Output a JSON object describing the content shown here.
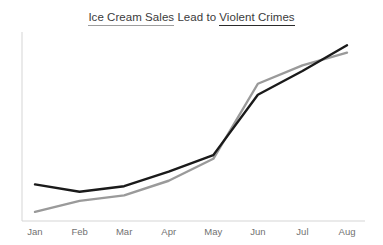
{
  "chart_data": {
    "type": "line",
    "title": "Ice Cream Sales Lead to Violent Crimes",
    "title_parts": [
      {
        "text": "Ice Cream Sales",
        "style": "underline-gray"
      },
      {
        "text": " Lead to ",
        "style": "plain"
      },
      {
        "text": "Violent Crimes",
        "style": "underline-dark"
      }
    ],
    "xlabel": "",
    "ylabel": "",
    "categories": [
      "Jan",
      "Feb",
      "Mar",
      "Apr",
      "May",
      "Jun",
      "Jul",
      "Aug"
    ],
    "xlim": [
      0,
      7
    ],
    "ylim": [
      0,
      100
    ],
    "grid": false,
    "legend_position": "none",
    "y_axis_ticks_visible": false,
    "axis_color": "#d5d5d5",
    "tick_label_color": "#717171",
    "series": [
      {
        "name": "Violent Crimes",
        "color": "#1a1a1a",
        "line_width": 2.4,
        "values": [
          20,
          16,
          19,
          27,
          36,
          69,
          82,
          96
        ]
      },
      {
        "name": "Ice Cream Sales",
        "color": "#9a9a9a",
        "line_width": 2.4,
        "values": [
          5,
          11,
          14,
          22,
          34,
          75,
          85,
          92
        ]
      }
    ]
  },
  "colors": {
    "background": "#ffffff",
    "series_dark": "#1a1a1a",
    "series_gray": "#9a9a9a",
    "axis": "#d5d5d5",
    "title_text": "#3b3b3b",
    "tick_text": "#717171"
  }
}
